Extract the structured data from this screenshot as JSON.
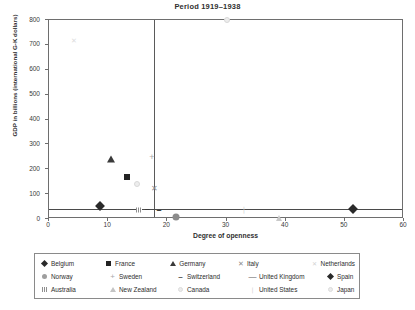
{
  "chart_data": {
    "type": "scatter",
    "title": "Period 1919–1938",
    "xlabel": "Degree of openness",
    "ylabel": "GDP in billions (international G-K dollars)",
    "xlim": [
      0,
      60
    ],
    "ylim": [
      0,
      800
    ],
    "xticks": [
      "0",
      "10",
      "20",
      "30",
      "40",
      "50",
      "60"
    ],
    "yticks": [
      "0",
      "100",
      "200",
      "300",
      "400",
      "500",
      "600",
      "700",
      "800"
    ],
    "grid": false,
    "legend_position": "below-plot",
    "reference_lines": [
      {
        "name": "vertical-openness-threshold",
        "axis": "x",
        "value": 17.8
      },
      {
        "name": "horizontal-gdp-threshold",
        "axis": "y",
        "value": 40
      }
    ],
    "series": [
      {
        "name": "Belgium",
        "marker": "filled-diamond",
        "color": "#2a2a2a",
        "x": 8.7,
        "y": 52
      },
      {
        "name": "France",
        "marker": "filled-square",
        "color": "#232323",
        "x": 13.2,
        "y": 170
      },
      {
        "name": "Germany",
        "marker": "filled-triangle",
        "color": "#3a3a3a",
        "x": 10.5,
        "y": 243
      },
      {
        "name": "Italy",
        "marker": "cross-x",
        "color": "#8a8a8a",
        "x": 17.9,
        "y": 120
      },
      {
        "name": "Netherlands",
        "marker": "light-x",
        "color": "#dcdcdc",
        "x": 4.2,
        "y": 720
      },
      {
        "name": "Norway",
        "marker": "dark-circle",
        "color": "#8c8c8c",
        "x": 21.5,
        "y": 8
      },
      {
        "name": "Sweden",
        "marker": "plus",
        "color": "#a8a8a8",
        "x": 17.4,
        "y": 248
      },
      {
        "name": "Switzerland",
        "marker": "dash",
        "color": "#3a3a3a",
        "x": 18.6,
        "y": 33
      },
      {
        "name": "United Kingdom",
        "marker": "long-dash",
        "color": "#555555",
        "x": 16.6,
        "y": 35
      },
      {
        "name": "Spain",
        "marker": "filled-diamond",
        "color": "#2a2a2a",
        "x": 51.3,
        "y": 42
      },
      {
        "name": "Australia",
        "marker": "hatched-square",
        "color": "#8f8f8f",
        "x": 15.2,
        "y": 36
      },
      {
        "name": "New Zealand",
        "marker": "open-triangle",
        "color": "#c4c4c4",
        "x": 38.8,
        "y": 6
      },
      {
        "name": "Canada",
        "marker": "open-circle",
        "color": "#ececec",
        "x": 14.9,
        "y": 140
      },
      {
        "name": "United States",
        "marker": "light-tick",
        "color": "#cfcfcf",
        "x": 33.0,
        "y": 40
      },
      {
        "name": "Japan",
        "marker": "pale-circle",
        "color": "#ededed",
        "x": 30.0,
        "y": 800
      }
    ]
  },
  "legend": {
    "rows": [
      [
        {
          "label": "Belgium",
          "sym": "ls-diamond"
        },
        {
          "label": "France",
          "sym": "ls-square"
        },
        {
          "label": "Germany",
          "sym": "ls-tri"
        },
        {
          "label": "Italy",
          "sym": "ls-x",
          "glyph": "✕"
        },
        {
          "label": "Netherlands",
          "sym": "ls-x-l",
          "glyph": "✕"
        }
      ],
      [
        {
          "label": "Norway",
          "sym": "ls-circle"
        },
        {
          "label": "Sweden",
          "sym": "ls-plus",
          "glyph": "+"
        },
        {
          "label": "Switzerland",
          "sym": "ls-dash",
          "glyph": "–"
        },
        {
          "label": "United Kingdom",
          "sym": "ls-hdash",
          "glyph": "—"
        },
        {
          "label": "Spain",
          "sym": "ls-diamond"
        }
      ],
      [
        {
          "label": "Australia",
          "sym": "ls-bar"
        },
        {
          "label": "New Zealand",
          "sym": "ls-tri-open"
        },
        {
          "label": "Canada",
          "sym": "ls-circle-o"
        },
        {
          "label": "United States",
          "sym": "ls-ast",
          "glyph": "❘"
        },
        {
          "label": "Japan",
          "sym": "ls-circle-o"
        }
      ]
    ]
  }
}
